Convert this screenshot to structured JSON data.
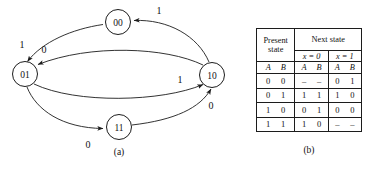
{
  "figure": {
    "part_a_caption": "(a)",
    "part_b_caption": "(b)"
  },
  "diagram": {
    "nodes": [
      {
        "id": "s00",
        "label": "00",
        "cx": 118,
        "cy": 22,
        "r": 12.5
      },
      {
        "id": "s01",
        "label": "01",
        "cx": 25,
        "cy": 74,
        "r": 12.5
      },
      {
        "id": "s10",
        "label": "10",
        "cx": 212,
        "cy": 75,
        "r": 12.5
      },
      {
        "id": "s11",
        "label": "11",
        "cx": 119,
        "cy": 127,
        "r": 12.5
      }
    ],
    "edges": [
      {
        "id": "e-10-00",
        "from": "10",
        "to": "00",
        "label": "1",
        "lx": 159,
        "ly": 10
      },
      {
        "id": "e-00-01",
        "from": "00",
        "to": "01",
        "label": "1",
        "lx": 22,
        "ly": 44
      },
      {
        "id": "e-10-01",
        "from": "10",
        "to": "01",
        "label": "0",
        "lx": 44,
        "ly": 49
      },
      {
        "id": "e-01-10",
        "from": "01",
        "to": "10",
        "label": "1",
        "lx": 180,
        "ly": 79
      },
      {
        "id": "e-11-10",
        "from": "11",
        "to": "10",
        "label": "0",
        "lx": 211,
        "ly": 105
      },
      {
        "id": "e-01-11",
        "from": "01",
        "to": "11",
        "label": "0",
        "lx": 88,
        "ly": 144
      }
    ]
  },
  "table": {
    "header": {
      "present_state": "Present\nstate",
      "present_state_line1": "Present",
      "present_state_line2": "state",
      "next_state": "Next state",
      "x0": "x = 0",
      "x1": "x = 1",
      "var_a": "A",
      "var_b": "B"
    },
    "rows": [
      {
        "present": [
          "0",
          "0"
        ],
        "next_x0": [
          "–",
          "–"
        ],
        "next_x1": [
          "0",
          "1"
        ]
      },
      {
        "present": [
          "0",
          "1"
        ],
        "next_x0": [
          "1",
          "1"
        ],
        "next_x1": [
          "1",
          "0"
        ]
      },
      {
        "present": [
          "1",
          "0"
        ],
        "next_x0": [
          "0",
          "1"
        ],
        "next_x1": [
          "0",
          "0"
        ]
      },
      {
        "present": [
          "1",
          "1"
        ],
        "next_x0": [
          "1",
          "0"
        ],
        "next_x1": [
          "–",
          "–"
        ]
      }
    ]
  },
  "colors": {
    "background": "#ffffff",
    "ink": "#1c1c1c",
    "text": "#111111"
  }
}
